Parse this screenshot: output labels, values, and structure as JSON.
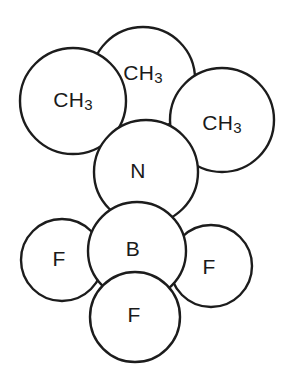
{
  "figure": {
    "kind": "space-filling-molecular-model",
    "background_color": "#ffffff",
    "outline_color": "#1c1c1c",
    "label_color": "#1a1a1a",
    "width": 290,
    "height": 374
  },
  "chart_data": {
    "type": "diagram",
    "title": "",
    "xlabel": "",
    "ylabel": "",
    "atoms": [
      {
        "id": "ch3-top",
        "label": "CH3",
        "label_main": "CH",
        "label_sub": "3",
        "cx": 143,
        "cy": 79,
        "r": 52,
        "draw_order": 1
      },
      {
        "id": "ch3-left",
        "label": "CH3",
        "label_main": "CH",
        "label_sub": "3",
        "cx": 73,
        "cy": 101,
        "r": 53,
        "draw_order": 2
      },
      {
        "id": "ch3-right",
        "label": "CH3",
        "label_main": "CH",
        "label_sub": "3",
        "cx": 222,
        "cy": 120,
        "r": 52,
        "draw_order": 3
      },
      {
        "id": "nitrogen",
        "label": "N",
        "label_main": "N",
        "label_sub": "",
        "cx": 146,
        "cy": 172,
        "r": 52,
        "draw_order": 4
      },
      {
        "id": "fluorine-left",
        "label": "F",
        "label_main": "F",
        "label_sub": "",
        "cx": 62,
        "cy": 260,
        "r": 41,
        "draw_order": 5
      },
      {
        "id": "fluorine-right",
        "label": "F",
        "label_main": "F",
        "label_sub": "",
        "cx": 211,
        "cy": 266,
        "r": 41,
        "draw_order": 6
      },
      {
        "id": "boron",
        "label": "B",
        "label_main": "B",
        "label_sub": "",
        "cx": 137,
        "cy": 251,
        "r": 49,
        "draw_order": 7
      },
      {
        "id": "fluorine-bottom",
        "label": "F",
        "label_main": "F",
        "label_sub": "",
        "cx": 135,
        "cy": 317,
        "r": 45,
        "draw_order": 8
      }
    ],
    "labels": [
      {
        "text": "CH3",
        "x": 143,
        "y": 74
      },
      {
        "text": "CH3",
        "x": 73,
        "y": 101
      },
      {
        "text": "CH3",
        "x": 222,
        "y": 124
      },
      {
        "text": "N",
        "x": 138,
        "y": 172
      },
      {
        "text": "F",
        "x": 59,
        "y": 260
      },
      {
        "text": "B",
        "x": 133,
        "y": 250
      },
      {
        "text": "F",
        "x": 209,
        "y": 268
      },
      {
        "text": "F",
        "x": 134,
        "y": 316
      }
    ]
  }
}
